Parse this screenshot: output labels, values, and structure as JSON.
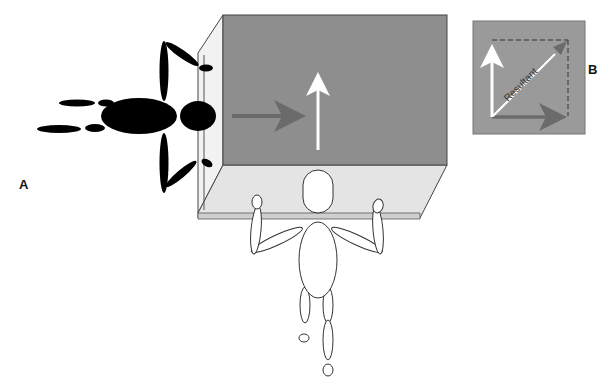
{
  "figure": {
    "panels": [
      {
        "id": "A",
        "label": "A",
        "description": "Two people pushing a box from perpendicular directions"
      },
      {
        "id": "B",
        "label": "B",
        "description": "Vector addition showing resultant"
      }
    ],
    "box": {
      "front_color": "#8e8e8e",
      "top_color": "#e4e4e4",
      "edge_color": "#444444"
    },
    "vectors": {
      "horizontal": {
        "name": "force-from-left-person",
        "color": "#6b6b6b",
        "direction": "right"
      },
      "vertical": {
        "name": "force-from-bottom-person",
        "color": "#ffffff",
        "direction": "up"
      },
      "resultant": {
        "label": "Resultant",
        "color": "#ffffff",
        "head_color": "#6b6b6b"
      }
    },
    "inset": {
      "background": "#9a9a9a",
      "resultant_label": "Resultant"
    },
    "people": [
      {
        "id": "left-person",
        "fill": "#000000",
        "view": "top-down pushing right"
      },
      {
        "id": "bottom-person",
        "fill": "#ffffff",
        "view": "top-down pushing up"
      }
    ]
  }
}
